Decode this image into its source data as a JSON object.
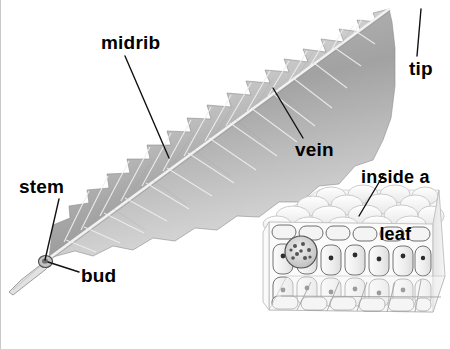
{
  "figure": {
    "style": "grayscale pencil botanical illustration",
    "background_color": "#ffffff",
    "label_color": "#000000",
    "leader_line_color": "#1a1a1a"
  },
  "labels": {
    "midrib": "midrib",
    "tip": "tip",
    "vein": "vein",
    "stem": "stem",
    "bud": "bud",
    "inside_a_leaf_line1": "inside a",
    "inside_a_leaf_line2": "leaf"
  },
  "parts": [
    {
      "name": "midrib",
      "label": "midrib",
      "description": "pale central rib running the length of the blade"
    },
    {
      "name": "tip",
      "label": "tip",
      "description": "pointed apex of the leaf at upper right"
    },
    {
      "name": "vein",
      "label": "vein",
      "description": "lateral vein branching from the midrib"
    },
    {
      "name": "stem",
      "label": "stem",
      "description": "petiole at the lower left base of the leaf"
    },
    {
      "name": "bud",
      "label": "bud",
      "description": "small bud at the junction of stem and blade"
    },
    {
      "name": "inside-a-leaf",
      "label": "inside a leaf",
      "description": "cut-away block showing internal leaf cells"
    }
  ],
  "inset": {
    "name": "leaf-cross-section-block",
    "caption": "inside a leaf",
    "features": [
      "upper epidermis",
      "palisade cells",
      "spongy cells",
      "vascular bundle",
      "lower epidermis"
    ]
  }
}
